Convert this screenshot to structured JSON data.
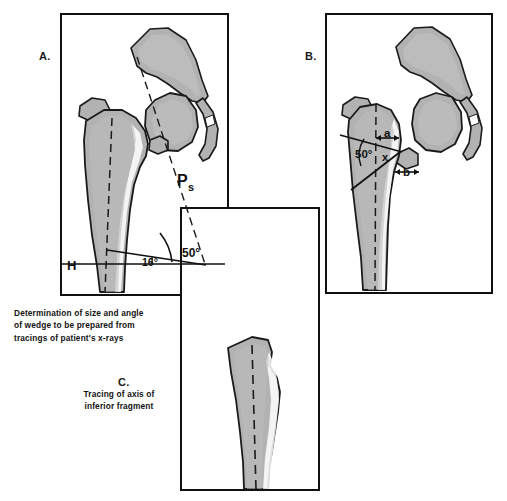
{
  "figure": {
    "background_color": "#ffffff",
    "bone_fill_color": "#b2b2b2",
    "bone_outline_color": "#1a1a1a",
    "line_color": "#111111"
  },
  "panels": [
    {
      "id": "A",
      "letter": "A.",
      "caption": "Determination of size and angle\nof wedge to be prepared from\ntracings of patient's x-rays",
      "labels": {
        "axis_label": "Ps",
        "horizontal_label": "H",
        "angle_small": "16°",
        "angle_large": "50°"
      }
    },
    {
      "id": "B",
      "letter": "B.",
      "caption": "",
      "labels": {
        "angle_large": "50°",
        "apex_point": "x",
        "dim_a": "a",
        "dim_b": "b",
        "dim_a_marked": "-a-",
        "dim_b_marked": "-b-"
      }
    },
    {
      "id": "C",
      "letter": "C.",
      "caption": "Tracing of axis of\ninferior fragment",
      "labels": {}
    }
  ],
  "measurements": {
    "wedge_angle_deg": 50,
    "shaft_angle_deg": 16,
    "degree_symbol": "°"
  }
}
